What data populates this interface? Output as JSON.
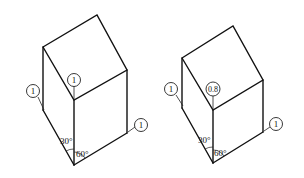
{
  "figures": [
    {
      "name": "cube-left",
      "coefficients": {
        "left_axis": "1",
        "vertical_axis": "1",
        "right_axis": "1"
      },
      "angles": {
        "left": "30°",
        "right": "60°"
      }
    },
    {
      "name": "cube-right",
      "coefficients": {
        "left_axis": "1",
        "vertical_axis": "0.8",
        "right_axis": "1"
      },
      "angles": {
        "left": "30°",
        "right": "60°"
      }
    }
  ],
  "colors": {
    "line": "#111111",
    "background": "#ffffff"
  }
}
